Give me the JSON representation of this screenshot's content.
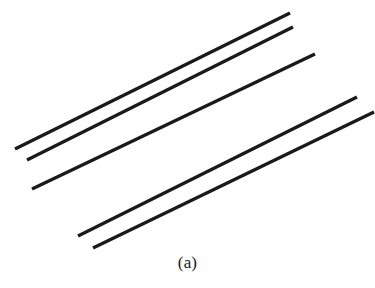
{
  "figure": {
    "caption": "(a)",
    "background_color": "#ffffff",
    "stroke_color": "#1a1a1a",
    "width": 375,
    "height": 288
  },
  "chart_data": {
    "type": "line",
    "title": "(a)",
    "subtitle": "",
    "xlabel": "",
    "ylabel": "",
    "grid": false,
    "legend": "none",
    "xlim": [
      0,
      375
    ],
    "ylim": [
      0,
      288
    ],
    "note": "Five parallel straight line segments drawn on a plain white ground; coordinates are in image pixel space with y increasing downward.",
    "series": [
      {
        "name": "line-1",
        "x": [
          15,
          290
        ],
        "y": [
          149,
          13
        ],
        "stroke_width": 3.4,
        "color": "#1a1a1a"
      },
      {
        "name": "line-2",
        "x": [
          27,
          293
        ],
        "y": [
          160,
          27
        ],
        "stroke_width": 3.4,
        "color": "#1a1a1a"
      },
      {
        "name": "line-3",
        "x": [
          32,
          315
        ],
        "y": [
          189,
          54
        ],
        "stroke_width": 3.4,
        "color": "#1a1a1a"
      },
      {
        "name": "line-4",
        "x": [
          78,
          357
        ],
        "y": [
          236,
          97
        ],
        "stroke_width": 3.4,
        "color": "#1a1a1a"
      },
      {
        "name": "line-5",
        "x": [
          93,
          374
        ],
        "y": [
          248,
          112
        ],
        "stroke_width": 3.4,
        "color": "#1a1a1a"
      }
    ]
  }
}
